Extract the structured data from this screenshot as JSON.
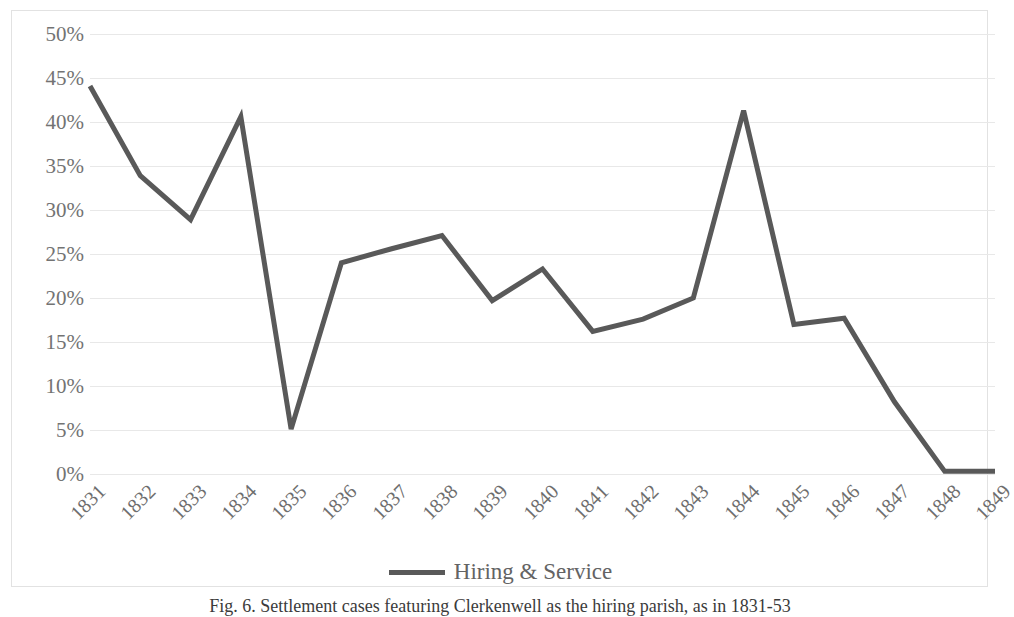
{
  "chart_data": {
    "type": "line",
    "title": "",
    "xlabel": "",
    "ylabel": "",
    "categories": [
      "1831",
      "1832",
      "1833",
      "1834",
      "1835",
      "1836",
      "1837",
      "1838",
      "1839",
      "1840",
      "1841",
      "1842",
      "1843",
      "1844",
      "1845",
      "1846",
      "1847",
      "1848",
      "1849"
    ],
    "series": [
      {
        "name": "Hiring & Service",
        "color": "#595959",
        "values": [
          44.1,
          33.9,
          28.9,
          40.6,
          5.1,
          24.0,
          25.6,
          27.1,
          19.7,
          23.3,
          16.2,
          17.6,
          20.0,
          41.3,
          17.0,
          17.7,
          8.2,
          0.3,
          0.3
        ]
      }
    ],
    "ylim": [
      0,
      50
    ],
    "ytick_values": [
      0,
      5,
      10,
      15,
      20,
      25,
      30,
      35,
      40,
      45,
      50
    ],
    "ytick_labels": [
      "0%",
      "5%",
      "10%",
      "15%",
      "20%",
      "25%",
      "30%",
      "35%",
      "40%",
      "45%",
      "50%"
    ],
    "grid": true,
    "grid_axis": "y",
    "legend_position": "bottom",
    "xtick_rotation": -45
  },
  "legend": {
    "entries": [
      {
        "label": "Hiring & Service",
        "color": "#595959"
      }
    ]
  },
  "caption": {
    "text": "Fig. 6. Settlement cases featuring Clerkenwell as the hiring parish, as in 1831-53"
  },
  "colors": {
    "line": "#595959",
    "gridline": "#e8e8e8",
    "frame_border": "#e2e2e2",
    "tick_text": "#737373",
    "background": "#ffffff"
  }
}
